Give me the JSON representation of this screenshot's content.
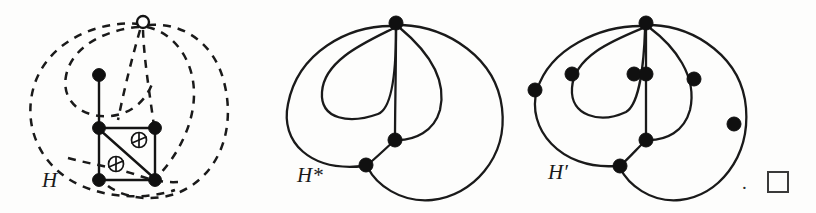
{
  "figure": {
    "caption_end_period": ".",
    "end_of_proof_symbol": "square",
    "background_color": "#fdfdfc",
    "ink_color": "#141414",
    "width": 816,
    "height": 213
  },
  "panels": [
    {
      "id": "H",
      "label": "H",
      "description": "planar-ish drawing with dashed edges and two crossing markers",
      "vertices": [
        {
          "name": "apex",
          "style": "hollow",
          "x": 143,
          "y": 22
        },
        {
          "name": "upper-left",
          "style": "filled",
          "x": 99,
          "y": 75
        },
        {
          "name": "square-top-left",
          "style": "filled",
          "x": 99,
          "y": 128
        },
        {
          "name": "square-top-right",
          "style": "filled",
          "x": 155,
          "y": 128
        },
        {
          "name": "square-bottom-left",
          "style": "filled",
          "x": 99,
          "y": 180
        },
        {
          "name": "square-bottom-right",
          "style": "filled",
          "x": 155,
          "y": 180
        }
      ],
      "crossings": [
        {
          "name": "crossing-upper",
          "x": 139,
          "y": 140
        },
        {
          "name": "crossing-lower",
          "x": 116,
          "y": 164
        }
      ],
      "edge_styles": [
        "solid",
        "dashed"
      ]
    },
    {
      "id": "H*",
      "label": "H*",
      "description": "curvilinear drawing with three filled vertices",
      "vertices": [
        {
          "name": "top",
          "style": "filled",
          "x": 396,
          "y": 23
        },
        {
          "name": "middle",
          "style": "filled",
          "x": 395,
          "y": 140
        },
        {
          "name": "lower-left",
          "style": "filled",
          "x": 366,
          "y": 165
        }
      ],
      "edge_styles": [
        "solid"
      ]
    },
    {
      "id": "H'",
      "label": "H′",
      "description": "subdivided drawing with nine filled vertices",
      "vertices": [
        {
          "name": "top",
          "style": "filled",
          "x": 646,
          "y": 23
        },
        {
          "name": "far-left",
          "style": "filled",
          "x": 534,
          "y": 90
        },
        {
          "name": "inner-left",
          "style": "filled",
          "x": 571,
          "y": 74
        },
        {
          "name": "center-left",
          "style": "filled",
          "x": 634,
          "y": 74
        },
        {
          "name": "center",
          "style": "filled",
          "x": 646,
          "y": 74
        },
        {
          "name": "center-right",
          "style": "filled",
          "x": 694,
          "y": 79
        },
        {
          "name": "far-right",
          "style": "filled",
          "x": 734,
          "y": 124
        },
        {
          "name": "middle",
          "style": "filled",
          "x": 646,
          "y": 140
        },
        {
          "name": "lower-left",
          "style": "filled",
          "x": 620,
          "y": 165
        }
      ],
      "edge_styles": [
        "solid"
      ]
    }
  ]
}
